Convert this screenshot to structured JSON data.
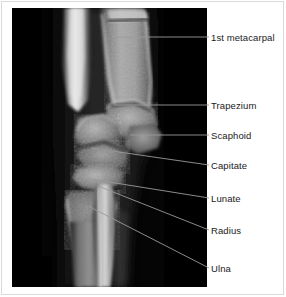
{
  "figure": {
    "kind": "annotated-radiograph",
    "view": "wrist x-ray, lateral / oblique",
    "width": 286,
    "height": 297,
    "background_color": "#ffffff",
    "border_color": "#d9d9d9",
    "xray_background_color": "#050505",
    "leader_line_color": "#9a9a9a",
    "label_text_color": "#1a1a1a"
  },
  "xray": {
    "name": "wrist-radiograph",
    "panel": {
      "x": 12,
      "y": 8,
      "width": 195,
      "height": 279
    }
  },
  "annotations": [
    {
      "id": "first-metacarpal",
      "label": "1st metacarpal",
      "label_x": 211,
      "label_y": 32,
      "leader": [
        [
          209,
          37
        ],
        [
          116,
          37
        ]
      ]
    },
    {
      "id": "trapezium",
      "label": "Trapezium",
      "label_x": 211,
      "label_y": 100,
      "leader": [
        [
          209,
          105
        ],
        [
          114,
          105
        ]
      ]
    },
    {
      "id": "scaphoid",
      "label": "Scaphoid",
      "label_x": 211,
      "label_y": 130,
      "leader": [
        [
          209,
          135
        ],
        [
          130,
          135
        ]
      ]
    },
    {
      "id": "capitate",
      "label": "Capitate",
      "label_x": 211,
      "label_y": 160,
      "leader": [
        [
          209,
          165
        ],
        [
          91,
          148
        ]
      ]
    },
    {
      "id": "lunate",
      "label": "Lunate",
      "label_x": 211,
      "label_y": 193,
      "leader": [
        [
          209,
          198
        ],
        [
          84,
          178
        ]
      ]
    },
    {
      "id": "radius",
      "label": "Radius",
      "label_x": 211,
      "label_y": 225,
      "leader": [
        [
          209,
          230
        ],
        [
          98,
          186
        ]
      ]
    },
    {
      "id": "ulna",
      "label": "Ulna",
      "label_x": 211,
      "label_y": 263,
      "leader": [
        [
          209,
          268
        ],
        [
          88,
          206
        ]
      ]
    }
  ]
}
